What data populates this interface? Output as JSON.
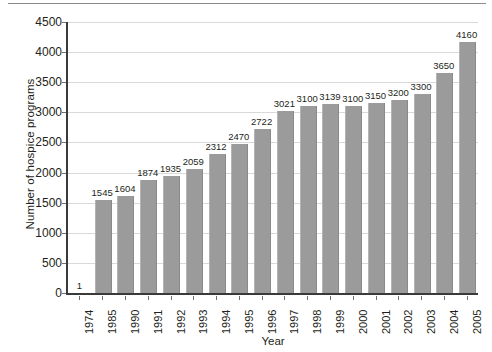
{
  "chart_data": {
    "type": "bar",
    "title": "",
    "xlabel": "Year",
    "ylabel": "Number of hospice programs",
    "ylim": [
      0,
      4500
    ],
    "ytick_step": 500,
    "yticks": [
      "0",
      "500",
      "1000",
      "1500",
      "2000",
      "2500",
      "3000",
      "3500",
      "4000",
      "4500"
    ],
    "grid": "horizontal",
    "legend": "none",
    "bar_color": "#9b9b9b",
    "axis_color": "#3a3a3a",
    "gridline_color": "#d9d9d9",
    "categories": [
      "1974",
      "1985",
      "1990",
      "1991",
      "1992",
      "1993",
      "1994",
      "1995",
      "1996",
      "1997",
      "1998",
      "1999",
      "2000",
      "2001",
      "2002",
      "2003",
      "2004",
      "2005"
    ],
    "values": [
      1,
      1545,
      1604,
      1874,
      1935,
      2059,
      2312,
      2470,
      2722,
      3021,
      3100,
      3139,
      3100,
      3150,
      3200,
      3300,
      3650,
      4160
    ],
    "data_labels": [
      "1",
      "1545",
      "1604",
      "1874",
      "1935",
      "2059",
      "2312",
      "2470",
      "2722",
      "3021",
      "3100",
      "3139",
      "3100",
      "3150",
      "3200",
      "3300",
      "3650",
      "4160"
    ]
  }
}
